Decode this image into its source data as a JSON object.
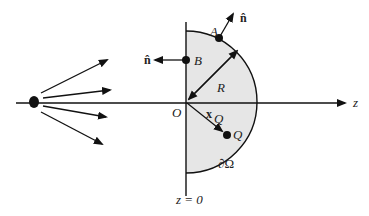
{
  "diagram": {
    "title": "",
    "labels": {
      "axis_z": "z",
      "origin": "O",
      "point_A": "A",
      "point_B": "B",
      "point_Q": "Q",
      "radius": "R",
      "normal_A": "n̂",
      "normal_B": "n̂",
      "position_vector": "x",
      "position_subscript": "Q",
      "boundary": "∂Ω",
      "plane": "z = 0"
    },
    "colors": {
      "region_fill": "#e6e6e6",
      "stroke": "#111111",
      "text": "#222222"
    },
    "geometry": {
      "origin": [
        186,
        102
      ],
      "radius_px": 71,
      "source_point": [
        34,
        100
      ],
      "source_rays": 5
    }
  }
}
